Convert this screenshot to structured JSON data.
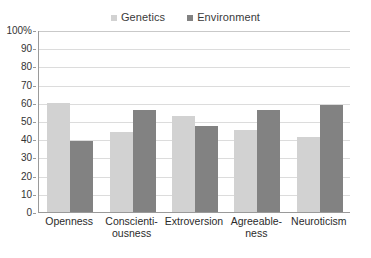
{
  "chart_data": {
    "type": "bar",
    "title": "",
    "xlabel": "",
    "ylabel": "",
    "ylim": [
      0,
      100
    ],
    "yticks": [
      "0",
      "10",
      "20",
      "30",
      "40",
      "50",
      "60",
      "70",
      "80",
      "90",
      "100%"
    ],
    "grid": true,
    "legend_position": "top-center",
    "categories": [
      "Openness",
      "Conscienti-\nousness",
      "Extroversion",
      "Agreeable-\nness",
      "Neuroticism"
    ],
    "category_lines": [
      [
        "Openness"
      ],
      [
        "Conscienti-",
        "ousness"
      ],
      [
        "Extroversion"
      ],
      [
        "Agreeable-",
        "ness"
      ],
      [
        "Neuroticism"
      ]
    ],
    "series": [
      {
        "name": "Genetics",
        "color": "#d2d2d2",
        "values": [
          60,
          44,
          53,
          45,
          41
        ]
      },
      {
        "name": "Environment",
        "color": "#828282",
        "values": [
          39,
          56,
          47,
          56,
          59
        ]
      }
    ]
  },
  "legend": {
    "items": [
      {
        "label": "Genetics",
        "color": "#d2d2d2"
      },
      {
        "label": "Environment",
        "color": "#828282"
      }
    ]
  },
  "axis": {
    "y_labels": [
      "100%",
      "90",
      "80",
      "70",
      "60",
      "50",
      "40",
      "30",
      "20",
      "10",
      "0"
    ]
  }
}
